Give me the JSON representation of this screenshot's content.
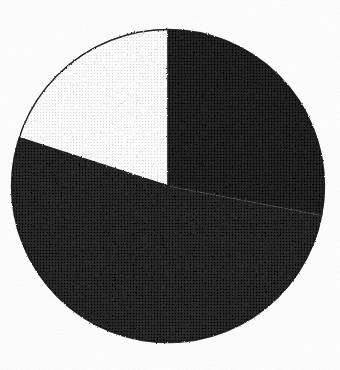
{
  "chart_data": {
    "type": "pie",
    "title": "",
    "subtitle": "",
    "xlabel": "",
    "ylabel": "",
    "grid": false,
    "legend": "none",
    "labels_shown": false,
    "start_angle_deg": 90,
    "direction": "clockwise",
    "center": {
      "x": 168,
      "y": 186
    },
    "radius": 157,
    "categories": [
      "Segment 1",
      "Segment 2",
      "Segment 3"
    ],
    "values": [
      28,
      52,
      20
    ],
    "percentages": [
      "28%",
      "52%",
      "20%"
    ],
    "angles_deg": [
      100.8,
      187.6,
      71.6
    ],
    "colors": [
      "#282828",
      "#242424",
      "#f2f2f2"
    ],
    "slices": [
      {
        "name": "Segment 1",
        "value": 28,
        "percent": "28%",
        "angle_deg": 100.8,
        "start_deg": 0,
        "end_deg": 100.8,
        "color": "#282828",
        "position": "upper-right"
      },
      {
        "name": "Segment 2",
        "value": 52,
        "percent": "52%",
        "angle_deg": 187.6,
        "start_deg": 100.8,
        "end_deg": 288.4,
        "color": "#242424",
        "position": "lower"
      },
      {
        "name": "Segment 3",
        "value": 20,
        "percent": "20%",
        "angle_deg": 71.6,
        "start_deg": 288.4,
        "end_deg": 360,
        "color": "#f2f2f2",
        "position": "upper-left"
      }
    ],
    "annotations": [],
    "notes": "Scanned halftone pie chart; no axis, legend, or data labels are printed in the image."
  },
  "figure": {
    "background_color": "#ffffff",
    "outline_color": "#1a1a1a",
    "render_style": "scanned-halftone"
  },
  "accessibility": {
    "alt_text": "Pie chart with three segments: a large dark lower segment, a dark upper-right segment, and a white upper-left segment."
  }
}
